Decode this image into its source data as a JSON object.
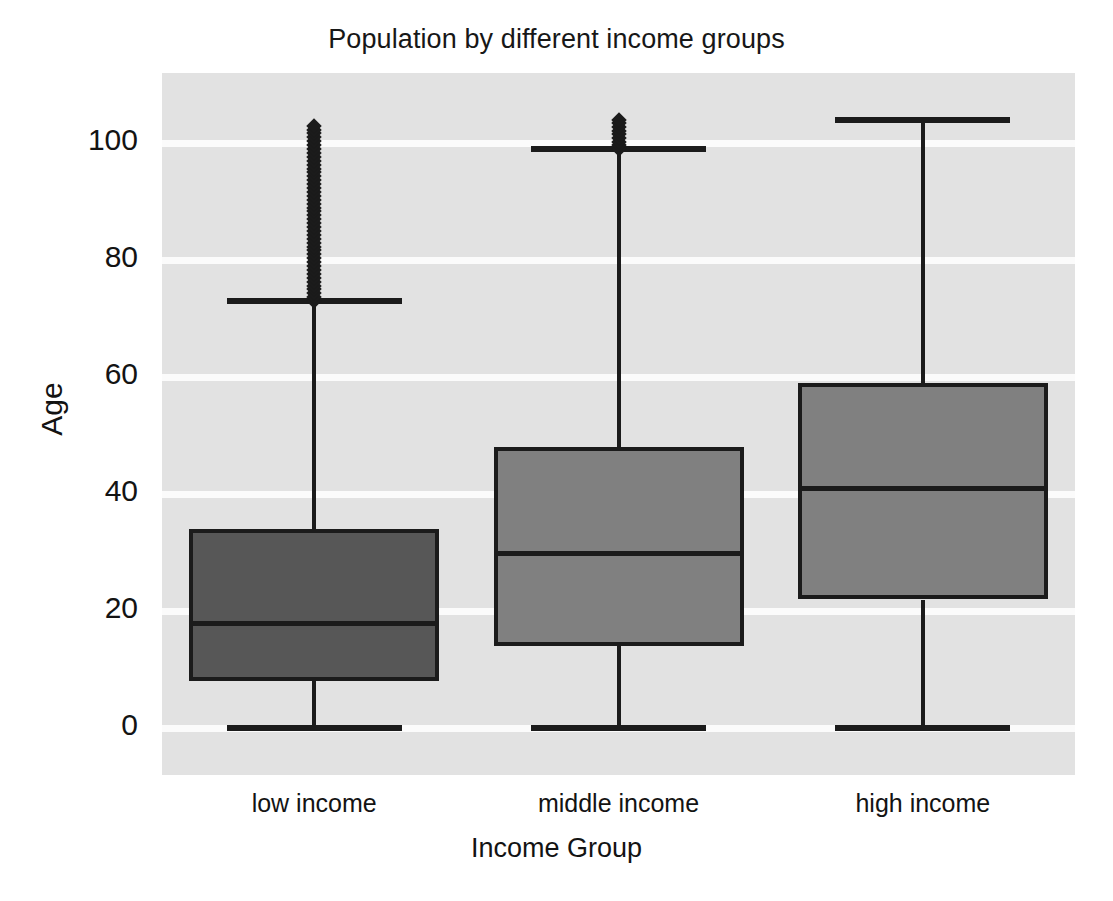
{
  "chart_data": {
    "type": "box",
    "title": "Population by different income groups",
    "xlabel": "Income Group",
    "ylabel": "Age",
    "categories": [
      "low income",
      "middle income",
      "high income"
    ],
    "ylim": [
      -8,
      112
    ],
    "yticks": [
      0,
      20,
      40,
      60,
      80,
      100
    ],
    "ytick_labels": [
      "0",
      "20",
      "40",
      "60",
      "80",
      "100"
    ],
    "grid": true,
    "legend": "none",
    "plot_background": "#e2e2e2",
    "gridline_color": "#fbfbfb",
    "boxes": [
      {
        "name": "low income",
        "whisker_low": 0,
        "q1": 8,
        "median": 18,
        "q3": 34,
        "whisker_high": 73,
        "outlier_min": 73,
        "outlier_max": 103,
        "outlier_count": 46,
        "fill": "#575757",
        "edge": "#1b1b1b"
      },
      {
        "name": "middle income",
        "whisker_low": 0,
        "q1": 14,
        "median": 30,
        "q3": 48,
        "whisker_high": 99,
        "outlier_min": 99,
        "outlier_max": 104,
        "outlier_count": 9,
        "fill": "#808080",
        "edge": "#1b1b1b"
      },
      {
        "name": "high income",
        "whisker_low": 0,
        "q1": 22,
        "median": 41,
        "q3": 59,
        "whisker_high": 104,
        "outlier_min": null,
        "outlier_max": null,
        "outlier_count": 0,
        "fill": "#808080",
        "edge": "#1b1b1b"
      }
    ]
  }
}
